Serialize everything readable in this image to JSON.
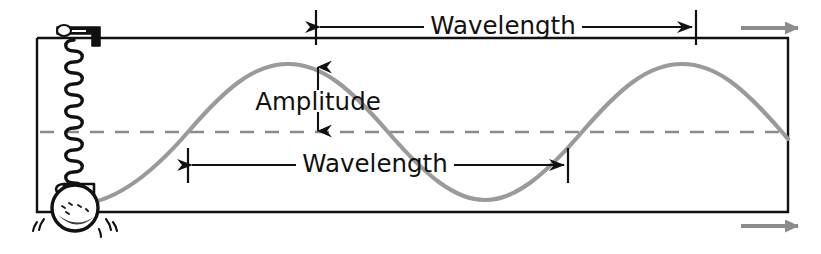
{
  "figure": {
    "kind": "physics-wave-diagram"
  },
  "labels": {
    "wavelength_top": "Wavelength",
    "wavelength_bottom": "Wavelength",
    "amplitude": "Amplitude"
  },
  "colors": {
    "ink": "#111111",
    "wave": "#9a9a9a",
    "dashed_axis": "#8a8a8a",
    "motion_arrow": "#8c8c8c",
    "background": "#ffffff"
  },
  "geometry": {
    "frame": {
      "left": 37,
      "top": 38,
      "right": 788,
      "bottom": 212
    },
    "equilibrium_y": 132,
    "crest_y": 64,
    "trough_y": 200,
    "amplitude_px": 68,
    "wavelength_px": 380
  },
  "annotations": {
    "wavelength_top_span": {
      "x1": 316,
      "x2": 696,
      "y": 27
    },
    "wavelength_bottom_span": {
      "x1": 188,
      "x2": 568,
      "y": 165
    },
    "amplitude_span": {
      "x": 318,
      "y1": 66,
      "y2": 131
    }
  },
  "motion_arrows": [
    {
      "name": "top-right-motion-arrow",
      "x1": 740,
      "x2": 800,
      "y": 28,
      "direction": "right"
    },
    {
      "name": "bottom-right-motion-arrow",
      "x1": 740,
      "x2": 800,
      "y": 226,
      "direction": "right"
    }
  ],
  "oscillator": {
    "anchor_label": "spring-anchor-bracket",
    "spring_label": "coil-spring",
    "bob_label": "hanging-mass-ball",
    "motion_lines_label": "vibration-motion-lines",
    "spring_top_y": 40,
    "spring_bottom_y": 186,
    "spring_x": 74,
    "bob_cx": 75,
    "bob_cy": 208,
    "bob_r": 22
  }
}
